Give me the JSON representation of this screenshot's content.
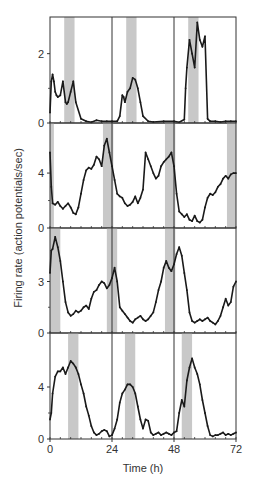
{
  "chart_data": [
    {
      "type": "line",
      "panel": 1,
      "yticks": [
        0,
        2
      ],
      "ylim": [
        0,
        3
      ],
      "shaded_intervals": [
        [
          5.5,
          9.5
        ],
        [
          29.5,
          33.5
        ],
        [
          53.5,
          57.5
        ]
      ],
      "vertical_lines": [
        24,
        48
      ],
      "series": [
        {
          "name": "panel1",
          "x": [
            0,
            0.5,
            1,
            1.5,
            2,
            2.5,
            3,
            4,
            5,
            6,
            6.5,
            7,
            8,
            9,
            10,
            12,
            14,
            16,
            18,
            20,
            22,
            24,
            26,
            27,
            28,
            28.5,
            29,
            30,
            31,
            32,
            33,
            34,
            35,
            36,
            38,
            40,
            44,
            48,
            50,
            52,
            52.5,
            53,
            54,
            55,
            56,
            57,
            58,
            59,
            60,
            61,
            62,
            64,
            66,
            68,
            70,
            72
          ],
          "y": [
            0.3,
            1.2,
            1.4,
            1.2,
            0.9,
            0.8,
            0.75,
            0.8,
            1.2,
            0.6,
            0.55,
            0.6,
            0.9,
            1.2,
            0.6,
            0.12,
            0.05,
            0.02,
            0.08,
            0.05,
            0.05,
            0.05,
            0.05,
            0.2,
            0.8,
            0.75,
            0.6,
            0.9,
            1.0,
            1.3,
            1.25,
            1.0,
            0.6,
            0.2,
            0.05,
            0.03,
            0.05,
            0.05,
            0.02,
            0.1,
            1.0,
            1.6,
            2.4,
            2.0,
            1.6,
            2.9,
            2.4,
            2.2,
            2.5,
            0.12,
            0.05,
            0.05,
            0.03,
            0.05,
            0.05,
            0.05
          ]
        }
      ]
    },
    {
      "type": "line",
      "panel": 2,
      "yticks": [
        0,
        4
      ],
      "ylim": [
        0,
        7.5
      ],
      "shaded_intervals": [
        [
          0,
          1.5
        ],
        [
          20.5,
          24.5
        ],
        [
          44.5,
          48.5
        ],
        [
          68.5,
          72
        ]
      ],
      "vertical_lines": [
        24,
        48
      ],
      "series": [
        {
          "name": "panel2",
          "x": [
            0,
            0.5,
            1,
            2,
            3,
            4,
            5,
            6,
            7,
            8,
            9,
            10,
            11,
            12,
            13,
            14,
            15,
            16,
            17,
            18,
            19,
            20,
            21,
            22,
            23,
            24,
            25,
            26,
            27,
            28,
            29,
            30,
            31,
            32,
            33,
            34,
            35,
            36,
            37,
            38,
            39,
            40,
            41,
            42,
            43,
            44,
            45,
            46,
            47,
            48,
            49,
            50,
            51,
            52,
            53,
            54,
            55,
            56,
            57,
            58,
            59,
            60,
            61,
            62,
            63,
            64,
            65,
            66,
            67,
            68,
            69,
            70,
            71,
            72
          ],
          "y": [
            5.5,
            3.0,
            1.8,
            1.7,
            1.9,
            1.6,
            1.4,
            1.6,
            1.8,
            1.5,
            1.1,
            1.0,
            1.5,
            2.5,
            3.5,
            4.2,
            4.4,
            4.3,
            4.6,
            5.2,
            5.0,
            4.5,
            6.0,
            6.5,
            5.5,
            4.5,
            3.5,
            2.5,
            2.3,
            2.2,
            1.8,
            1.6,
            1.7,
            1.9,
            2.3,
            1.8,
            2.2,
            2.8,
            5.5,
            5.0,
            4.5,
            4.0,
            3.6,
            3.8,
            4.5,
            4.8,
            5.0,
            5.2,
            5.5,
            4.5,
            2.5,
            1.2,
            1.0,
            0.8,
            1.0,
            0.6,
            0.5,
            0.9,
            0.5,
            0.4,
            0.6,
            1.5,
            2.2,
            2.5,
            2.4,
            2.6,
            3.0,
            3.2,
            3.6,
            3.8,
            3.6,
            3.9,
            4.0,
            4.0
          ]
        }
      ]
    },
    {
      "type": "line",
      "panel": 3,
      "yticks": [
        0,
        3
      ],
      "ylim": [
        0,
        6
      ],
      "shaded_intervals": [
        [
          0,
          4
        ],
        [
          22,
          26
        ],
        [
          44.5,
          48.5
        ]
      ],
      "vertical_lines": [
        24,
        48
      ],
      "series": [
        {
          "name": "panel3",
          "x": [
            0,
            0.5,
            1,
            2,
            3,
            4,
            5,
            6,
            7,
            8,
            9,
            10,
            11,
            12,
            13,
            14,
            15,
            16,
            17,
            18,
            19,
            20,
            21,
            22,
            23,
            24,
            25,
            26,
            27,
            28,
            29,
            30,
            31,
            32,
            33,
            34,
            35,
            36,
            37,
            38,
            39,
            40,
            41,
            42,
            43,
            44,
            45,
            46,
            47,
            48,
            49,
            50,
            51,
            52,
            53,
            54,
            55,
            56,
            57,
            58,
            59,
            60,
            61,
            62,
            63,
            64,
            65,
            66,
            67,
            68,
            69,
            70,
            71,
            72
          ],
          "y": [
            3.5,
            4.8,
            4.9,
            5.6,
            5.0,
            4.2,
            3.0,
            1.8,
            1.2,
            1.0,
            1.1,
            1.3,
            1.2,
            1.3,
            1.5,
            1.6,
            1.4,
            2.0,
            2.4,
            2.5,
            2.8,
            3.0,
            2.9,
            2.6,
            2.8,
            3.2,
            3.8,
            3.0,
            1.5,
            1.3,
            1.1,
            0.9,
            0.7,
            0.6,
            0.8,
            0.9,
            1.0,
            0.8,
            0.7,
            0.8,
            1.0,
            1.2,
            1.8,
            2.5,
            3.0,
            3.8,
            4.2,
            3.8,
            3.6,
            4.0,
            4.6,
            5.0,
            4.5,
            3.5,
            2.5,
            1.2,
            0.7,
            0.6,
            0.7,
            0.8,
            0.7,
            0.8,
            0.9,
            0.7,
            0.6,
            0.5,
            0.7,
            1.0,
            1.5,
            2.0,
            1.6,
            1.8,
            2.7,
            3.0
          ]
        }
      ]
    },
    {
      "type": "line",
      "panel": 4,
      "yticks": [
        0,
        4
      ],
      "ylim": [
        0,
        8
      ],
      "shaded_intervals": [
        [
          7,
          11
        ],
        [
          29,
          33
        ],
        [
          51,
          55
        ]
      ],
      "vertical_lines": [
        24,
        48
      ],
      "series": [
        {
          "name": "panel4",
          "x": [
            0,
            0.5,
            1,
            2,
            3,
            4,
            5,
            6,
            7,
            8,
            9,
            10,
            11,
            12,
            13,
            14,
            15,
            16,
            17,
            18,
            19,
            20,
            21,
            22,
            23,
            24,
            25,
            26,
            27,
            28,
            29,
            30,
            31,
            32,
            33,
            34,
            35,
            36,
            37,
            38,
            39,
            40,
            41,
            42,
            43,
            44,
            45,
            46,
            47,
            48,
            49,
            50,
            51,
            52,
            53,
            54,
            55,
            56,
            57,
            58,
            59,
            60,
            61,
            62,
            63,
            64,
            65,
            66,
            67,
            68,
            69,
            70,
            71,
            72
          ],
          "y": [
            1.5,
            2.0,
            3.5,
            4.8,
            5.2,
            5.2,
            5.5,
            5.0,
            5.5,
            6.0,
            5.8,
            5.5,
            5.0,
            4.2,
            3.5,
            2.5,
            1.8,
            1.0,
            0.5,
            0.3,
            0.4,
            0.6,
            0.7,
            0.6,
            0.2,
            0.3,
            0.8,
            1.5,
            2.8,
            3.5,
            3.8,
            4.2,
            4.2,
            4.0,
            3.5,
            2.5,
            1.5,
            0.8,
            1.5,
            1.4,
            0.5,
            0.3,
            0.4,
            0.5,
            0.3,
            0.4,
            0.5,
            0.4,
            0.3,
            0.5,
            0.6,
            2.0,
            3.0,
            2.5,
            4.5,
            5.5,
            6.2,
            5.5,
            5.0,
            4.2,
            3.0,
            2.0,
            1.0,
            0.3,
            0.2,
            0.3,
            0.3,
            0.4,
            0.5,
            0.3,
            0.4,
            0.3,
            0.4,
            0.5
          ]
        }
      ]
    }
  ],
  "axes": {
    "xlabel": "Time (h)",
    "ylabel": "Firing rate (action potentials/sec)",
    "xticks": [
      0,
      24,
      48,
      72
    ],
    "xlim": [
      0,
      72
    ]
  }
}
